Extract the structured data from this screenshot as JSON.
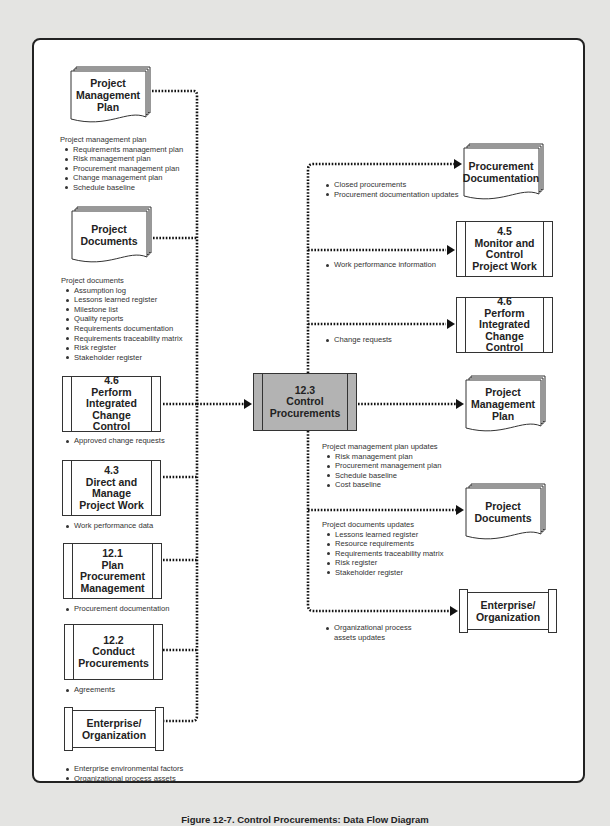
{
  "caption": "Figure 12-7. Control Procurements: Data Flow Diagram",
  "central_process": {
    "number": "12.3",
    "name": "Control\nProcurements",
    "fill": "#b3b3b3"
  },
  "inputs": [
    {
      "kind": "document",
      "title": "Project\nManagement\nPlan",
      "label_heading": "Project management plan",
      "items": [
        "Requirements management plan",
        "Risk management plan",
        "Procurement management plan",
        "Change management plan",
        "Schedule baseline"
      ]
    },
    {
      "kind": "document",
      "title": "Project\nDocuments",
      "label_heading": "Project documents",
      "items": [
        "Assumption log",
        "Lessons learned register",
        "Milestone list",
        "Quality reports",
        "Requirements documentation",
        "Requirements traceability matrix",
        "Risk register",
        "Stakeholder register"
      ]
    },
    {
      "kind": "process",
      "title": "4.6\nPerform\nIntegrated\nChange Control",
      "items": [
        "Approved change requests"
      ]
    },
    {
      "kind": "process",
      "title": "4.3\nDirect and\nManage\nProject Work",
      "items": [
        "Work performance data"
      ]
    },
    {
      "kind": "process",
      "title": "12.1\nPlan\nProcurement\nManagement",
      "items": [
        "Procurement documentation"
      ]
    },
    {
      "kind": "process",
      "title": "12.2\nConduct\nProcurements",
      "items": [
        "Agreements"
      ]
    },
    {
      "kind": "entity",
      "title": "Enterprise/\nOrganization",
      "items": [
        "Enterprise environmental factors",
        "Organizational process assets"
      ]
    }
  ],
  "outputs": [
    {
      "kind": "document",
      "title": "Procurement\nDocumentation",
      "items": [
        "Closed procurements",
        "Procurement documentation updates"
      ]
    },
    {
      "kind": "process",
      "title": "4.5\nMonitor and\nControl\nProject Work",
      "items": [
        "Work performance information"
      ]
    },
    {
      "kind": "process",
      "title": "4.6\nPerform\nIntegrated\nChange Control",
      "items": [
        "Change requests"
      ]
    },
    {
      "kind": "document",
      "title": "Project\nManagement\nPlan",
      "label_heading": "Project management plan updates",
      "items": [
        "Risk management plan",
        "Procurement management plan",
        "Schedule baseline",
        "Cost baseline"
      ]
    },
    {
      "kind": "document",
      "title": "Project\nDocuments",
      "label_heading": "Project documents updates",
      "items": [
        "Lessons learned register",
        "Resource requirements",
        "Requirements traceability matrix",
        "Risk register",
        "Stakeholder register"
      ]
    },
    {
      "kind": "entity",
      "title": "Enterprise/\nOrganization",
      "items": [
        "Organizational process\nassets updates"
      ]
    }
  ]
}
